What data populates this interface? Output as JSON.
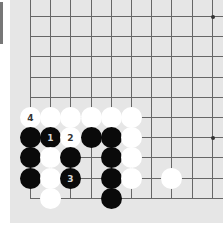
{
  "board": {
    "background": "#e6e6e6",
    "grid_origin_x": 30,
    "grid_origin_y": 16,
    "spacing": 20.2,
    "visible_cols": 10,
    "visible_rows": 10,
    "edges": {
      "left": true,
      "bottom": true,
      "top": false,
      "right": false
    },
    "star_points": [
      {
        "col": 9,
        "row": 0
      },
      {
        "col": 9,
        "row": 6
      }
    ]
  },
  "stones": [
    {
      "color": "white",
      "col": 0,
      "row": 5,
      "label": "4"
    },
    {
      "color": "white",
      "col": 1,
      "row": 5,
      "label": ""
    },
    {
      "color": "white",
      "col": 2,
      "row": 5,
      "label": ""
    },
    {
      "color": "white",
      "col": 3,
      "row": 5,
      "label": ""
    },
    {
      "color": "white",
      "col": 4,
      "row": 5,
      "label": ""
    },
    {
      "color": "white",
      "col": 5,
      "row": 5,
      "label": ""
    },
    {
      "color": "black",
      "col": 0,
      "row": 6,
      "label": ""
    },
    {
      "color": "black",
      "col": 1,
      "row": 6,
      "label": "1"
    },
    {
      "color": "white",
      "col": 2,
      "row": 6,
      "label": "2"
    },
    {
      "color": "black",
      "col": 3,
      "row": 6,
      "label": ""
    },
    {
      "color": "black",
      "col": 4,
      "row": 6,
      "label": ""
    },
    {
      "color": "white",
      "col": 5,
      "row": 6,
      "label": ""
    },
    {
      "color": "black",
      "col": 0,
      "row": 7,
      "label": ""
    },
    {
      "color": "white",
      "col": 1,
      "row": 7,
      "label": ""
    },
    {
      "color": "black",
      "col": 2,
      "row": 7,
      "label": ""
    },
    {
      "color": "black",
      "col": 4,
      "row": 7,
      "label": ""
    },
    {
      "color": "white",
      "col": 5,
      "row": 7,
      "label": ""
    },
    {
      "color": "black",
      "col": 0,
      "row": 8,
      "label": ""
    },
    {
      "color": "white",
      "col": 1,
      "row": 8,
      "label": ""
    },
    {
      "color": "black",
      "col": 2,
      "row": 8,
      "label": "3"
    },
    {
      "color": "black",
      "col": 4,
      "row": 8,
      "label": ""
    },
    {
      "color": "white",
      "col": 5,
      "row": 8,
      "label": ""
    },
    {
      "color": "white",
      "col": 7,
      "row": 8,
      "label": ""
    },
    {
      "color": "white",
      "col": 1,
      "row": 9,
      "label": ""
    },
    {
      "color": "black",
      "col": 4,
      "row": 9,
      "label": ""
    }
  ]
}
